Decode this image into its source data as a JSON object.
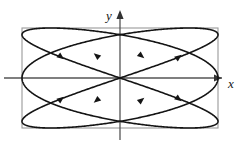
{
  "figure": {
    "title": "",
    "axes": {
      "x_label": "x",
      "y_label": "y",
      "x_axis_color": "#555555",
      "y_axis_color": "#555555",
      "arrow_color": "#333333"
    },
    "bounding_box_color": "#9a9a9a",
    "curve_color": "#141414"
  },
  "chart_data": {
    "type": "line",
    "title": "",
    "subtitle": "",
    "xlabel": "x",
    "ylabel": "y",
    "xlim": [
      -1,
      1
    ],
    "ylim": [
      -1,
      1
    ],
    "grid": false,
    "legend": null,
    "annotations": [
      {
        "text": "x",
        "x": 1.06,
        "y": -0.12
      },
      {
        "text": "y",
        "x": -0.08,
        "y": 1.12
      }
    ],
    "parametric": {
      "x_expression": "sin(3t)",
      "y_expression": "sin(2t)",
      "t_range": [
        0,
        6.283185307179586
      ],
      "frequency_ratio": "3:2",
      "phase": 0
    },
    "bounding_box": {
      "x_min": -1,
      "x_max": 1,
      "y_min": -1,
      "y_max": 1
    },
    "tangent_points": {
      "top": [
        -0.866,
        0.0,
        0.866
      ],
      "bottom": [
        -0.866,
        0.0,
        0.866
      ],
      "left": [
        -0.707,
        0.707
      ],
      "right": [
        -0.707,
        0.707
      ]
    },
    "direction_arrows": [
      {
        "x": -0.6,
        "y": 0.42,
        "angle_deg": -38
      },
      {
        "x": -0.24,
        "y": 0.45,
        "angle_deg": 140
      },
      {
        "x": 0.22,
        "y": 0.44,
        "angle_deg": -40
      },
      {
        "x": 0.6,
        "y": 0.42,
        "angle_deg": 38
      },
      {
        "x": -0.6,
        "y": -0.42,
        "angle_deg": 38
      },
      {
        "x": -0.24,
        "y": -0.45,
        "angle_deg": 220
      },
      {
        "x": 0.22,
        "y": -0.44,
        "angle_deg": 40
      },
      {
        "x": 0.6,
        "y": -0.42,
        "angle_deg": -38
      }
    ],
    "series": [
      {
        "name": "x = sin(3t), y = sin(2t)",
        "x": [
          0.0,
          0.309,
          0.588,
          0.809,
          0.951,
          1.0,
          0.951,
          0.809,
          0.588,
          0.309,
          0.0,
          -0.309,
          -0.588,
          -0.809,
          -0.951,
          -1.0,
          -0.951,
          -0.809,
          -0.588,
          -0.309,
          0.0,
          0.309,
          0.588,
          0.809,
          0.951,
          1.0,
          0.951,
          0.809,
          0.588,
          0.309,
          0.0
        ],
        "y": [
          0.0,
          0.208,
          0.406,
          0.588,
          0.743,
          0.866,
          0.951,
          0.995,
          0.995,
          0.951,
          0.866,
          0.743,
          0.588,
          0.406,
          0.208,
          0.0,
          -0.208,
          -0.406,
          -0.588,
          -0.743,
          -0.866,
          -0.951,
          -0.995,
          -0.995,
          -0.951,
          -0.866,
          -0.743,
          -0.588,
          -0.406,
          -0.208,
          0.0
        ]
      }
    ]
  }
}
